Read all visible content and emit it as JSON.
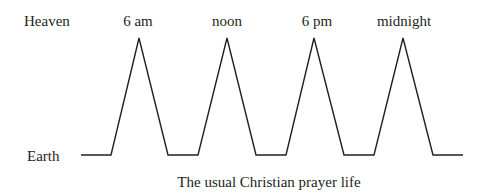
{
  "diagram": {
    "levels": {
      "top": "Heaven",
      "bottom": "Earth"
    },
    "peaks": [
      {
        "label": "6 am",
        "x": 139
      },
      {
        "label": "noon",
        "x": 227
      },
      {
        "label": "6 pm",
        "x": 314
      },
      {
        "label": "midnight",
        "x": 403
      }
    ],
    "caption": "The usual Christian prayer life",
    "line_color": "#231f20"
  }
}
